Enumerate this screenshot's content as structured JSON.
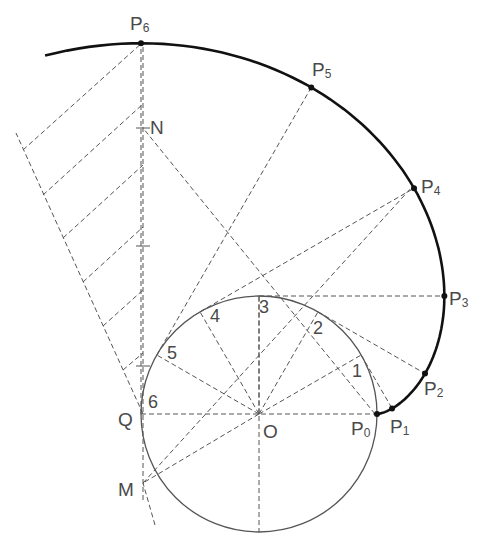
{
  "diagram": {
    "type": "circle involute construction",
    "center": {
      "label": "O",
      "x": 259,
      "y": 414
    },
    "radius": 118,
    "divisions": 12,
    "circle_point_labels": [
      "1",
      "2",
      "3",
      "4",
      "5",
      "6"
    ],
    "involute_points": [
      {
        "label": "P",
        "sub": "0"
      },
      {
        "label": "P",
        "sub": "1"
      },
      {
        "label": "P",
        "sub": "2"
      },
      {
        "label": "P",
        "sub": "3"
      },
      {
        "label": "P",
        "sub": "4"
      },
      {
        "label": "P",
        "sub": "5"
      },
      {
        "label": "P",
        "sub": "6"
      }
    ],
    "other_labels": {
      "Q": "Q",
      "M": "M",
      "N": "N",
      "O": "O"
    }
  }
}
